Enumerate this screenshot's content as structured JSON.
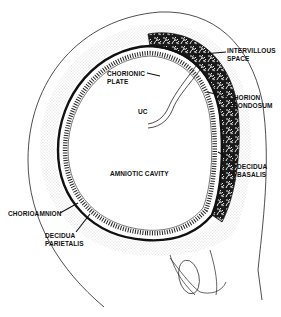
{
  "diagram": {
    "colors": {
      "ink": "#111111",
      "stipple": "#bdbdbd",
      "background": "#ffffff"
    },
    "labels": {
      "intervillous_space": "INTERVILLOUS\nSPACE",
      "chorion_frondosum": "CHORION\nFRONDOSUM",
      "chorionic_plate": "CHORIONIC\nPLATE",
      "uc": "UC",
      "amniotic_cavity": "AMNIOTIC CAVITY",
      "decidua_basalis": "DECIDUA\nBASALIS",
      "chorioamnion": "CHORIOAMNION",
      "decidua_parietalis": "DECIDUA\nPARIETALIS"
    }
  }
}
